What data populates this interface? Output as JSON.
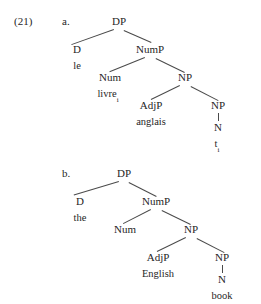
{
  "figure": {
    "number": "(21)",
    "examples": [
      {
        "letter": "a.",
        "language": "French",
        "nodes": {
          "dp": "DP",
          "d": "D",
          "d_lex": "le",
          "nump": "NumP",
          "num": "Num",
          "num_lex": "livre",
          "num_lex_sub": "i",
          "np_outer": "NP",
          "adjp": "AdjP",
          "adjp_lex": "anglais",
          "np_inner": "NP",
          "n": "N",
          "n_lex": "t",
          "n_lex_sub": "i"
        }
      },
      {
        "letter": "b.",
        "language": "English",
        "nodes": {
          "dp": "DP",
          "d": "D",
          "d_lex": "the",
          "nump": "NumP",
          "num": "Num",
          "num_lex": "",
          "np_outer": "NP",
          "adjp": "AdjP",
          "adjp_lex": "English",
          "np_inner": "NP",
          "n": "N",
          "n_lex": "book"
        }
      }
    ]
  },
  "style": {
    "ink": "#262626",
    "line": "#4a4a4a",
    "background": "#ffffff"
  }
}
